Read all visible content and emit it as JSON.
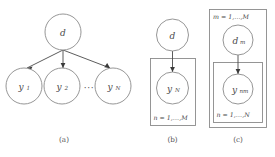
{
  "figure": {
    "background": "#ffffff",
    "stroke_color": "#8a8a8a",
    "edge_color": "#4a4a4a",
    "text_color": "#4a4a4a"
  },
  "panels": [
    {
      "id": "a",
      "caption": "(a)",
      "nodes": [
        {
          "id": "d",
          "base": "d",
          "sub": ""
        },
        {
          "id": "y1",
          "base": "y",
          "sub": "1"
        },
        {
          "id": "y2",
          "base": "y",
          "sub": "2"
        },
        {
          "id": "yN",
          "base": "y",
          "sub": "N"
        }
      ],
      "ellipsis": "···",
      "plates": []
    },
    {
      "id": "b",
      "caption": "(b)",
      "nodes": [
        {
          "id": "d",
          "base": "d",
          "sub": ""
        },
        {
          "id": "yN",
          "base": "y",
          "sub": "N"
        }
      ],
      "plates": [
        {
          "id": "plate-n",
          "label": "n = 1,…,M",
          "label_position": "bottom-left"
        }
      ]
    },
    {
      "id": "c",
      "caption": "(c)",
      "nodes": [
        {
          "id": "dm",
          "base": "d",
          "sub": "m"
        },
        {
          "id": "ynm",
          "base": "y",
          "sub": "nm"
        }
      ],
      "plates": [
        {
          "id": "plate-m",
          "label": "m = 1,…,M",
          "label_position": "top-left"
        },
        {
          "id": "plate-n",
          "label": "n = 1,…,N",
          "label_position": "bottom-left"
        }
      ]
    }
  ]
}
